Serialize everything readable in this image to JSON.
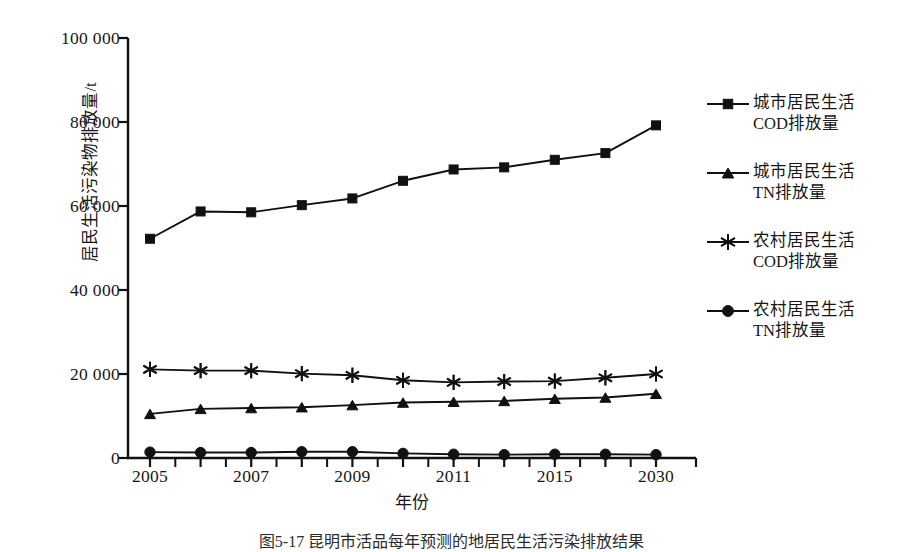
{
  "figure": {
    "caption": "图5-17  昆明市活品每年预测的地居民生活污染排放结果"
  },
  "axes": {
    "x_title": "年份",
    "y_title": "居民生活污染物排放量/t",
    "y_ticks": [
      "0",
      "20 000",
      "40 000",
      "60 000",
      "80 000",
      "100 000"
    ],
    "x_ticks": [
      "2005",
      "2007",
      "2009",
      "2011",
      "2015",
      "2030"
    ]
  },
  "legend": {
    "position": "right",
    "items": [
      {
        "label": "城市居民生活\nCOD排放量",
        "marker": "square",
        "color": "#111111"
      },
      {
        "label": "城市居民生活\nTN排放量",
        "marker": "triangle",
        "color": "#111111"
      },
      {
        "label": "农村居民生活\nCOD排放量",
        "marker": "star",
        "color": "#111111"
      },
      {
        "label": "农村居民生活\nTN排放量",
        "marker": "circle",
        "color": "#111111"
      }
    ]
  },
  "chart_data": {
    "type": "line",
    "title": "",
    "xlabel": "年份",
    "ylabel": "居民生活污染物排放量/t",
    "ylim": [
      0,
      100000
    ],
    "ytick_values": [
      0,
      20000,
      40000,
      60000,
      80000,
      100000
    ],
    "grid": false,
    "legend_position": "right",
    "categories": [
      "2005",
      "2006",
      "2007",
      "2008",
      "2009",
      "2010",
      "2011",
      "2013",
      "2015",
      "2020",
      "2030"
    ],
    "xtick_labeled": [
      "2005",
      "",
      "2007",
      "",
      "2009",
      "",
      "2011",
      "",
      "2015",
      "",
      "2030"
    ],
    "series": [
      {
        "name": "城市居民生活COD排放量",
        "marker": "square",
        "color": "#111111",
        "values": [
          52200,
          58700,
          58500,
          60200,
          61800,
          66000,
          68700,
          69200,
          71000,
          72600,
          79200
        ]
      },
      {
        "name": "城市居民生活TN排放量",
        "marker": "triangle",
        "color": "#111111",
        "values": [
          10500,
          11700,
          11900,
          12100,
          12600,
          13200,
          13400,
          13600,
          14100,
          14400,
          15300
        ]
      },
      {
        "name": "农村居民生活COD排放量",
        "marker": "star",
        "color": "#111111",
        "values": [
          21100,
          20800,
          20800,
          20100,
          19700,
          18500,
          18000,
          18200,
          18300,
          19100,
          20000
        ]
      },
      {
        "name": "农村居民生活TN排放量",
        "marker": "circle",
        "color": "#111111",
        "values": [
          1400,
          1300,
          1300,
          1500,
          1500,
          1100,
          900,
          800,
          900,
          900,
          800
        ]
      }
    ]
  },
  "style": {
    "axis_color": "#111111",
    "line_color": "#111111",
    "background": "#ffffff"
  }
}
